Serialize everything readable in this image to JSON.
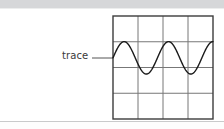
{
  "figure": {
    "title": "trace",
    "background_color": "#ffffff",
    "header_band_color": "#d6d7d9",
    "footer_rule_color": "#c9cacb"
  },
  "annotation": {
    "label": "trace",
    "leader_line": {
      "from_x": 92,
      "to_x": 113,
      "y": 58,
      "color": "#555555"
    }
  },
  "scope": {
    "frame": {
      "x": 113,
      "y": 16,
      "width": 100,
      "height": 103,
      "border_color": "#3c3c3c",
      "grid_color": "#777777",
      "columns": 4,
      "rows": 4
    }
  },
  "chart_data": {
    "type": "line",
    "title": "trace",
    "xlabel": "",
    "ylabel": "",
    "grid": true,
    "legend": null,
    "annotations": [
      {
        "text": "trace",
        "points_to": "waveform-left-edge"
      }
    ],
    "axis": {
      "xlim": [
        0,
        4
      ],
      "ylim": [
        -2,
        2
      ],
      "x_divisions": 4,
      "y_divisions": 4,
      "x_ticks": [
        0,
        1,
        2,
        3,
        4
      ],
      "y_ticks": [
        -2,
        -1,
        0,
        1,
        2
      ],
      "x_tick_labels": [
        "",
        "",
        "",
        "",
        ""
      ],
      "y_tick_labels": [
        "",
        "",
        "",
        "",
        ""
      ]
    },
    "series": [
      {
        "name": "trace",
        "waveform": "sine",
        "color": "#1a1a1a",
        "line_width": 1.4,
        "amplitude": 1,
        "cycles": 2.25,
        "phase_deg": 0,
        "offset": 0,
        "peak_value": 1,
        "trough_value": -1,
        "midline_value": 0
      }
    ]
  }
}
